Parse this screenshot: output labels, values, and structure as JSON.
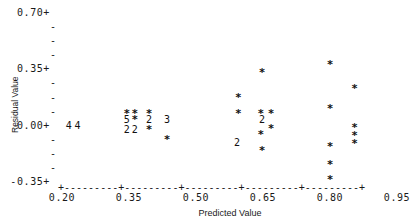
{
  "chart_data": {
    "type": "scatter",
    "title": "",
    "xlabel": "Predicted Value",
    "ylabel": "Residual Value",
    "xlim": [
      0.2,
      0.95
    ],
    "ylim": [
      -0.35,
      0.7
    ],
    "grid": false,
    "legend": null,
    "xticks": [
      "0.20",
      "0.35",
      "0.50",
      "0.65",
      "0.80",
      "0.95"
    ],
    "xtick_values": [
      0.2,
      0.35,
      0.5,
      0.65,
      0.8,
      0.95
    ],
    "yticks": [
      "0.70+",
      "0.35+",
      "0.00+",
      "-0.35+"
    ],
    "ytick_values": [
      0.7,
      0.35,
      0.0,
      -0.35
    ],
    "ytick_minor_glyph": "-",
    "ytick_major_glyph": "+",
    "point_glyph": "*",
    "note": "Character plot; a digit marks the number of overlapping observations at that cell.",
    "points": [
      {
        "x": 0.215,
        "y": 0.0,
        "label": "4",
        "count": 4
      },
      {
        "x": 0.235,
        "y": 0.0,
        "label": "4",
        "count": 4
      },
      {
        "x": 0.345,
        "y": 0.075,
        "label": "*",
        "count": 1
      },
      {
        "x": 0.363,
        "y": 0.075,
        "label": "*",
        "count": 1
      },
      {
        "x": 0.345,
        "y": 0.035,
        "label": "5",
        "count": 5
      },
      {
        "x": 0.363,
        "y": 0.035,
        "label": "*",
        "count": 1
      },
      {
        "x": 0.345,
        "y": -0.03,
        "label": "2",
        "count": 2
      },
      {
        "x": 0.363,
        "y": -0.03,
        "label": "2",
        "count": 2
      },
      {
        "x": 0.395,
        "y": 0.075,
        "label": "*",
        "count": 1
      },
      {
        "x": 0.395,
        "y": 0.035,
        "label": "2",
        "count": 2
      },
      {
        "x": 0.395,
        "y": -0.03,
        "label": "*",
        "count": 1
      },
      {
        "x": 0.435,
        "y": 0.035,
        "label": "3",
        "count": 3
      },
      {
        "x": 0.435,
        "y": -0.09,
        "label": "*",
        "count": 1
      },
      {
        "x": 0.595,
        "y": 0.175,
        "label": "*",
        "count": 1
      },
      {
        "x": 0.595,
        "y": 0.075,
        "label": "*",
        "count": 1
      },
      {
        "x": 0.592,
        "y": -0.11,
        "label": "2",
        "count": 2
      },
      {
        "x": 0.648,
        "y": 0.325,
        "label": "*",
        "count": 1
      },
      {
        "x": 0.645,
        "y": 0.075,
        "label": "*",
        "count": 1
      },
      {
        "x": 0.648,
        "y": 0.035,
        "label": "2",
        "count": 2
      },
      {
        "x": 0.645,
        "y": -0.06,
        "label": "*",
        "count": 1
      },
      {
        "x": 0.648,
        "y": -0.155,
        "label": "*",
        "count": 1
      },
      {
        "x": 0.668,
        "y": 0.075,
        "label": "*",
        "count": 1
      },
      {
        "x": 0.668,
        "y": -0.02,
        "label": "*",
        "count": 1
      },
      {
        "x": 0.8,
        "y": 0.375,
        "label": "*",
        "count": 1
      },
      {
        "x": 0.8,
        "y": 0.105,
        "label": "*",
        "count": 1
      },
      {
        "x": 0.8,
        "y": -0.135,
        "label": "*",
        "count": 1
      },
      {
        "x": 0.8,
        "y": -0.245,
        "label": "*",
        "count": 1
      },
      {
        "x": 0.8,
        "y": -0.335,
        "label": "*",
        "count": 1
      },
      {
        "x": 0.855,
        "y": 0.225,
        "label": "*",
        "count": 1
      },
      {
        "x": 0.855,
        "y": -0.015,
        "label": "*",
        "count": 1
      },
      {
        "x": 0.855,
        "y": -0.065,
        "label": "*",
        "count": 1
      },
      {
        "x": 0.855,
        "y": -0.115,
        "label": "*",
        "count": 1
      }
    ]
  },
  "axes": {
    "x_title": "Predicted Value",
    "y_title": "Residual Value",
    "x_tick_labels": [
      "0.20",
      "0.35",
      "0.50",
      "0.65",
      "0.80",
      "0.95"
    ],
    "y_tick_labels": [
      "0.70+",
      "0.35+",
      "0.00+",
      "-0.35+"
    ],
    "x_axis_line": "+---------+---------+---------+---------+---------+"
  }
}
